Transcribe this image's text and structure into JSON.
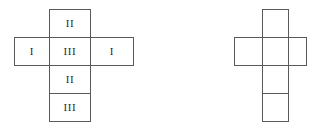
{
  "figure": {
    "background_color": "#ffffff",
    "line_color": "#5a5a5a",
    "label_color": "#2b2b2b",
    "diagram_count": 2,
    "diagrams": [
      {
        "id": "left-net",
        "name": "labelled-cube-net",
        "shape": "latin-cross",
        "cells": [
          {
            "position": "top",
            "label": "II",
            "col": 1,
            "row": 0
          },
          {
            "position": "middle-left",
            "label": "I",
            "col": 0,
            "row": 1
          },
          {
            "position": "middle-center",
            "label": "III",
            "col": 1,
            "row": 1
          },
          {
            "position": "middle-right",
            "label": "I",
            "col": 2,
            "row": 1
          },
          {
            "position": "lower",
            "label": "II",
            "col": 1,
            "row": 2
          },
          {
            "position": "bottom",
            "label": "III",
            "col": 1,
            "row": 3
          }
        ]
      },
      {
        "id": "right-net",
        "name": "blank-cube-net",
        "shape": "latin-cross",
        "cells": [
          {
            "position": "top",
            "label": "",
            "col": 1,
            "row": 0
          },
          {
            "position": "middle-left",
            "label": "",
            "col": 0,
            "row": 1
          },
          {
            "position": "middle-center",
            "label": "",
            "col": 1,
            "row": 1
          },
          {
            "position": "middle-right",
            "label": "",
            "col": 2,
            "row": 1
          },
          {
            "position": "lower",
            "label": "",
            "col": 1,
            "row": 2
          },
          {
            "position": "bottom",
            "label": "",
            "col": 1,
            "row": 3
          }
        ]
      }
    ]
  }
}
